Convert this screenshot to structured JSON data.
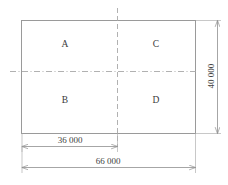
{
  "drawing": {
    "type": "site-plan-quadrant-diagram",
    "units_note": "",
    "outline": {
      "x": 21,
      "y": 20,
      "width": 174,
      "height": 113
    },
    "zones": [
      {
        "id": "A",
        "label": "A",
        "cx": 65,
        "cy": 45,
        "quadrant": "top-left"
      },
      {
        "id": "C",
        "label": "C",
        "cx": 156,
        "cy": 45,
        "quadrant": "top-right"
      },
      {
        "id": "B",
        "label": "B",
        "cx": 65,
        "cy": 101,
        "quadrant": "bottom-left"
      },
      {
        "id": "D",
        "label": "D",
        "cx": 156,
        "cy": 101,
        "quadrant": "bottom-right"
      }
    ],
    "centerlines": {
      "vertical": {
        "x": 117,
        "y1": 8,
        "y2": 146
      },
      "horizontal": {
        "y": 71,
        "x1": 10,
        "x2": 196
      }
    },
    "dimensions": [
      {
        "name": "overall-height",
        "value": "40 000",
        "orientation": "vertical",
        "line_x": 217,
        "y1": 20,
        "y2": 133,
        "label_x": 211,
        "label_y": 76,
        "extension_from_x": 196,
        "extension_y_top": 20,
        "extension_y_bottom": 133
      },
      {
        "name": "partial-width",
        "value": "36 000",
        "orientation": "horizontal",
        "line_y": 146,
        "x1": 22,
        "x2": 117,
        "label_x": 70,
        "label_y": 140
      },
      {
        "name": "overall-width",
        "value": "66 000",
        "orientation": "horizontal",
        "line_y": 167,
        "x1": 22,
        "x2": 195,
        "label_x": 108,
        "label_y": 161
      }
    ],
    "colors": {
      "outline": "#9a9a9a",
      "centerline": "#a8a8a8",
      "dimension_line": "#8f8f8f",
      "extension_line": "#b0b0b0",
      "text": "#3a3a3a",
      "background": "#ffffff"
    }
  }
}
